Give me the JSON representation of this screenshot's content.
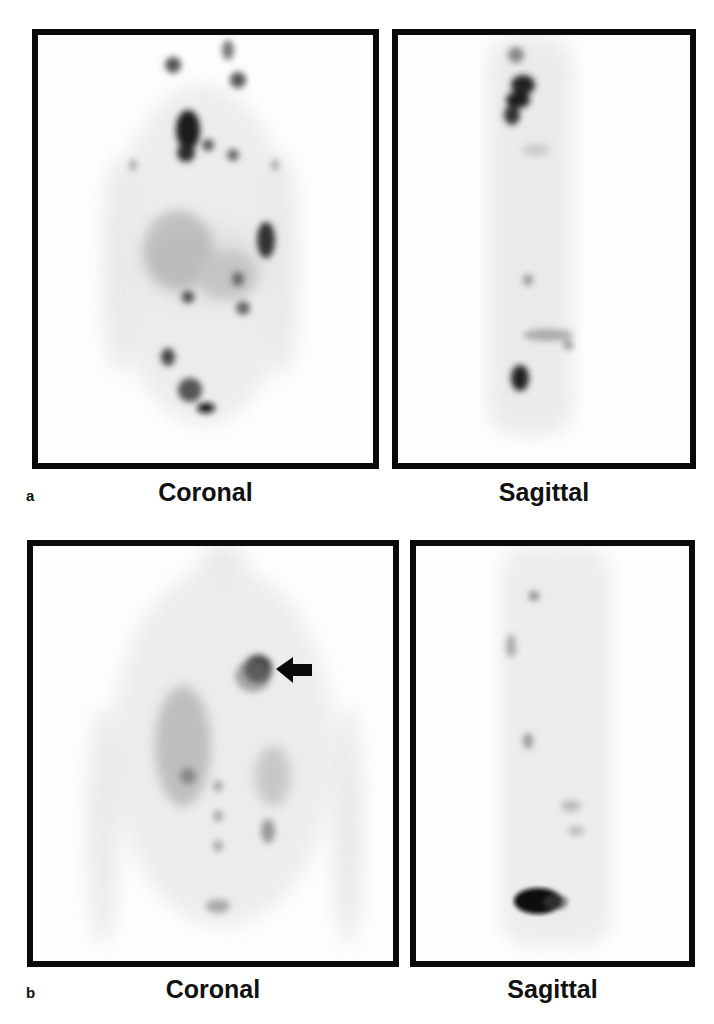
{
  "figure": {
    "panel_a": {
      "letter": "a",
      "views": [
        {
          "label": "Coronal"
        },
        {
          "label": "Sagittal"
        }
      ]
    },
    "panel_b": {
      "letter": "b",
      "views": [
        {
          "label": "Coronal"
        },
        {
          "label": "Sagittal"
        }
      ],
      "annotation": "arrow-left"
    }
  },
  "colors": {
    "border": "#0a0a0a",
    "uptake": "#1a1a1a",
    "background": "#ffffff"
  }
}
